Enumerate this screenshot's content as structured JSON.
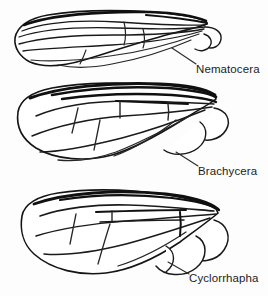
{
  "figure": {
    "background_color": "#fdfdfd",
    "ink_color": "#141414",
    "width": 268,
    "height": 296,
    "style": "black-ink line drawing"
  },
  "panels": [
    {
      "id": "nematocera",
      "label": "Nematocera",
      "order": 1,
      "description": "Long narrow wing with many longitudinal veins reaching the margin; few crossveins",
      "label_position": {
        "x": 196,
        "y": 63
      }
    },
    {
      "id": "brachycera",
      "label": "Brachycera",
      "order": 2,
      "description": "Broader wing with heavier anterior veins, distinct discal cell and closed cells",
      "label_position": {
        "x": 198,
        "y": 165
      }
    },
    {
      "id": "cyclorrhapha",
      "label": "Cyclorrhapha",
      "order": 3,
      "description": "Reduced venation, crowded anterior veins, large alula and calypters at base",
      "label_position": {
        "x": 189,
        "y": 272
      }
    }
  ],
  "labels": {
    "nematocera": "Nematocera",
    "brachycera": "Brachycera",
    "cyclorrhapha": "Cyclorrhapha"
  }
}
